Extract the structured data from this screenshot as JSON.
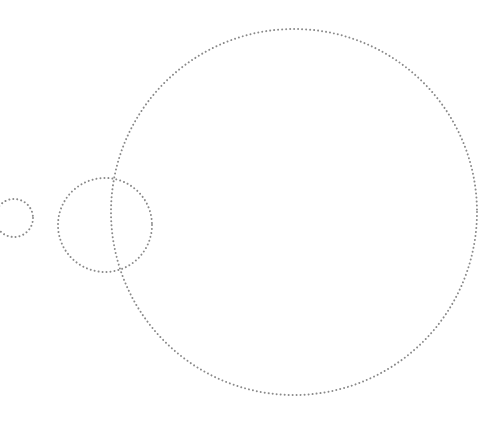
{
  "canvas": {
    "width": 490,
    "height": 435,
    "background": "#ffffff"
  },
  "style": {
    "stroke": "#8a8a8a",
    "dot_size": 2,
    "dot_gap": 3
  },
  "circles": [
    {
      "name": "small-circle",
      "cx": 14,
      "cy": 218,
      "r": 19
    },
    {
      "name": "medium-circle",
      "cx": 105,
      "cy": 225,
      "r": 47
    },
    {
      "name": "large-circle",
      "cx": 294,
      "cy": 212,
      "r": 183
    }
  ]
}
